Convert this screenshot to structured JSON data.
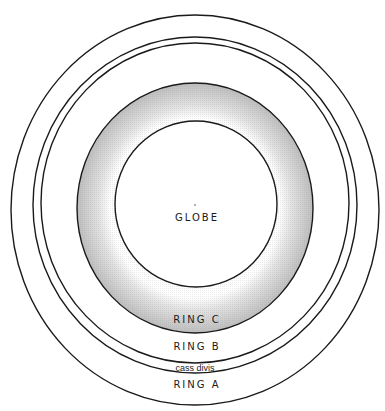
{
  "diagram": {
    "type": "planetary-ring-schematic",
    "center": {
      "x": 195,
      "y": 207
    },
    "colors": {
      "stroke": "#1a1a1a",
      "shading": "#bdbdbd",
      "background": "#ffffff"
    },
    "labels": {
      "globe": "GLOBE",
      "ring_c": "RING C",
      "ring_b": "RING B",
      "cassini_division": "cass divis",
      "ring_a": "RING A"
    },
    "rings": [
      {
        "name": "ring-a-outer-edge",
        "rx": 184,
        "ry": 195
      },
      {
        "name": "ring-a-inner-edge",
        "rx": 162,
        "ry": 168
      },
      {
        "name": "ring-b-outer-edge",
        "rx": 154,
        "ry": 160
      },
      {
        "name": "ring-c-outer-edge",
        "rx": 118,
        "ry": 125
      },
      {
        "name": "globe-edge",
        "rx": 81,
        "ry": 83
      }
    ]
  }
}
